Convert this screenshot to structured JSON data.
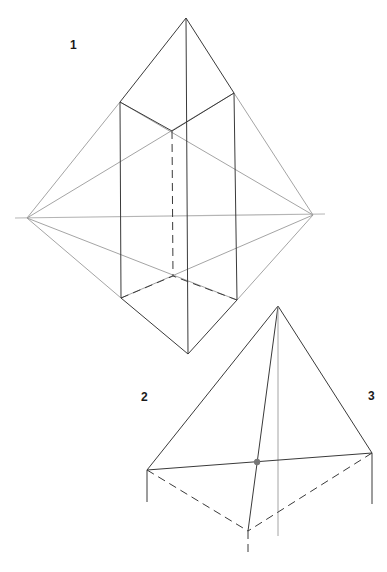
{
  "labels": {
    "figure1": "1",
    "figure2": "2",
    "figure3": "3"
  },
  "colors": {
    "background": "#ffffff",
    "edge": "#3a3a3a",
    "construction": "#9a9a9a",
    "horizon": "#b5b5b5",
    "centroid_dot": "#777777"
  },
  "figure1": {
    "description": "Octahedron-like prism in two-point perspective with horizon line",
    "vanishing_points": {
      "left": [
        27,
        218
      ],
      "right": [
        313,
        215
      ]
    },
    "horizon": {
      "x1": 15,
      "y1": 218,
      "x2": 325,
      "y2": 214
    },
    "apex_top": [
      186,
      18
    ],
    "apex_bottom": [
      188,
      354
    ],
    "top_face": {
      "left": [
        120,
        102
      ],
      "right": [
        234,
        93
      ],
      "back": [
        172,
        131
      ]
    },
    "bottom_face": {
      "left": [
        121,
        298
      ],
      "right": [
        237,
        300
      ],
      "back": [
        173,
        276
      ]
    }
  },
  "figure2": {
    "description": "Pyramid with dashed hidden base edges and centroid point",
    "apex": [
      278,
      306
    ],
    "base_left": [
      147,
      470
    ],
    "base_right": [
      372,
      453
    ],
    "base_front": [
      248,
      531
    ],
    "centroid": [
      257,
      462
    ]
  }
}
